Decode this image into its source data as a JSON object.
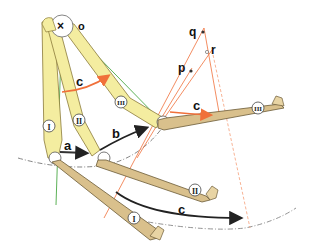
{
  "diagram": {
    "type": "mechanics / finger-bone flexion diagram",
    "pivot_label": "o",
    "point_labels": {
      "p": "p",
      "q": "q",
      "r": "r"
    },
    "motion_labels": {
      "a": "a",
      "b": "b",
      "c_top": "c",
      "c_right": "c",
      "c_bottom": "c"
    },
    "bone_labels": {
      "I_top": "I",
      "II_top": "II",
      "III_top": "III",
      "I_bottom": "I",
      "II_bottom": "II",
      "III_right": "III"
    },
    "colors": {
      "bone_yellow": "#f4eda0",
      "bone_yellow_stroke": "#8a7a3a",
      "bone_tan": "#d9c08c",
      "bone_tan_stroke": "#6b5a36",
      "orange_line": "#f0703a",
      "green_line": "#4aa844",
      "dash_arc": "#666666",
      "arrow_dark": "#222222"
    }
  }
}
